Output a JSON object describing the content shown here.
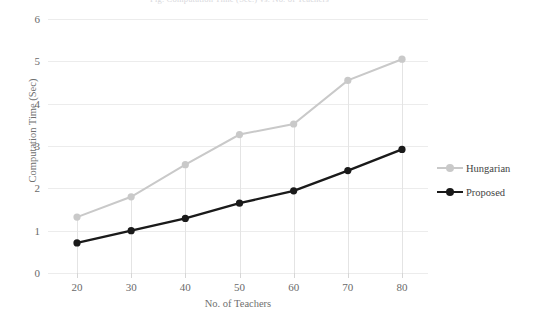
{
  "top_caption": "Fig. Computation Time (Sec.) vs. No. of Teachers",
  "chart_data": {
    "type": "line",
    "title": "",
    "xlabel": "No. of Teachers",
    "ylabel": "Computation Time (Sec)",
    "categories": [
      20,
      30,
      40,
      50,
      60,
      70,
      80
    ],
    "xtick_labels": [
      "20",
      "30",
      "40",
      "50",
      "60",
      "70",
      "80"
    ],
    "ytick_labels": [
      "0",
      "1",
      "2",
      "3",
      "4",
      "5",
      "6"
    ],
    "yticks": [
      0,
      1,
      2,
      3,
      4,
      5,
      6
    ],
    "ylim": [
      0,
      6
    ],
    "xlim": [
      20,
      80
    ],
    "grid": "horizontal",
    "legend_position": "right",
    "series": [
      {
        "name": "Hungarian",
        "color": "#c9c9c9",
        "marker": "circle",
        "values": [
          1.32,
          1.8,
          2.56,
          3.27,
          3.52,
          4.55,
          5.05
        ]
      },
      {
        "name": "Proposed",
        "color": "#1a1a1a",
        "marker": "circle",
        "values": [
          0.71,
          1.0,
          1.29,
          1.65,
          1.94,
          2.42,
          2.92
        ]
      }
    ]
  },
  "colors": {
    "hungarian": "#c9c9c9",
    "proposed": "#1a1a1a",
    "grid": "#ececec",
    "axis_text": "#6a6a6a"
  }
}
